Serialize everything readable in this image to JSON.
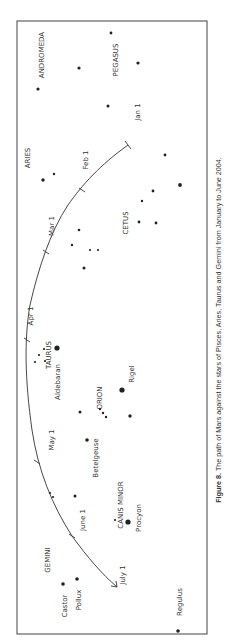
{
  "figure": {
    "caption_bold": "Figure 8.",
    "caption_text": " The path of Mars against the stars of Pisces, Aries, Taurus and Gemini from January to June 2004."
  },
  "colors": {
    "ink": "#222222",
    "frame": "#444444",
    "background": "#ffffff"
  },
  "chart_data": {
    "type": "scatter",
    "title": "The path of Mars against the stars of Pisces, Aries, Taurus and Gemini from January to June 2004",
    "orientation": "rotated 90° counter-clockwise (landscape figure on portrait page)",
    "frame": {
      "x0": 17,
      "y0": 21,
      "x1": 207,
      "y1": 634
    },
    "constellations": [
      {
        "name": "ANDROMEDA",
        "x": 44,
        "y": 55
      },
      {
        "name": "PEGASUS",
        "x": 118,
        "y": 60
      },
      {
        "name": "ARIES",
        "x": 30,
        "y": 158
      },
      {
        "name": "CETUS",
        "x": 128,
        "y": 223
      },
      {
        "name": "TAURUS",
        "x": 51,
        "y": 355
      },
      {
        "name": "ORION",
        "x": 102,
        "y": 398
      },
      {
        "name": "CANIS MINOR",
        "x": 123,
        "y": 505
      },
      {
        "name": "GEMINI",
        "x": 50,
        "y": 560
      }
    ],
    "named_stars": [
      {
        "name": "Aldebaran",
        "x": 57,
        "y": 348,
        "label_x": 60,
        "label_y": 382
      },
      {
        "name": "Rigel",
        "x": 122,
        "y": 390,
        "label_x": 134,
        "label_y": 374
      },
      {
        "name": "Betelgeuse",
        "x": 87,
        "y": 440,
        "label_x": 98,
        "label_y": 458
      },
      {
        "name": "Procyon",
        "x": 128,
        "y": 522,
        "label_x": 141,
        "label_y": 518
      },
      {
        "name": "Castor",
        "x": 63,
        "y": 584,
        "label_x": 67,
        "label_y": 606
      },
      {
        "name": "Pollux",
        "x": 77,
        "y": 579,
        "label_x": 81,
        "label_y": 600
      },
      {
        "name": "Regulus",
        "x": 178,
        "y": 631,
        "label_x": 182,
        "label_y": 602
      }
    ],
    "stars": [
      {
        "x": 38,
        "y": 89,
        "r": 1.6
      },
      {
        "x": 79,
        "y": 68,
        "r": 1.6
      },
      {
        "x": 111,
        "y": 33,
        "r": 1.4
      },
      {
        "x": 138,
        "y": 63,
        "r": 1.6
      },
      {
        "x": 108,
        "y": 106,
        "r": 1.5
      },
      {
        "x": 165,
        "y": 155,
        "r": 1.4
      },
      {
        "x": 43,
        "y": 180,
        "r": 1.7
      },
      {
        "x": 54,
        "y": 174,
        "r": 1.2
      },
      {
        "x": 180,
        "y": 185,
        "r": 1.9
      },
      {
        "x": 153,
        "y": 191,
        "r": 1.4
      },
      {
        "x": 142,
        "y": 201,
        "r": 1.2
      },
      {
        "x": 139,
        "y": 222,
        "r": 1.4
      },
      {
        "x": 156,
        "y": 223,
        "r": 1.4
      },
      {
        "x": 79,
        "y": 230,
        "r": 1.3
      },
      {
        "x": 72,
        "y": 245,
        "r": 1.2
      },
      {
        "x": 90,
        "y": 250,
        "r": 1.1
      },
      {
        "x": 98,
        "y": 250,
        "r": 1.1
      },
      {
        "x": 84,
        "y": 268,
        "r": 1.5
      },
      {
        "x": 35,
        "y": 362,
        "r": 1.1
      },
      {
        "x": 39,
        "y": 355,
        "r": 1.1
      },
      {
        "x": 45,
        "y": 361,
        "r": 1.1
      },
      {
        "x": 44,
        "y": 349,
        "r": 1.1
      },
      {
        "x": 80,
        "y": 412,
        "r": 1.5
      },
      {
        "x": 100,
        "y": 409,
        "r": 1.2
      },
      {
        "x": 103,
        "y": 413,
        "r": 1.2
      },
      {
        "x": 106,
        "y": 417,
        "r": 1.2
      },
      {
        "x": 130,
        "y": 416,
        "r": 1.7
      },
      {
        "x": 75,
        "y": 496,
        "r": 1.5
      },
      {
        "x": 115,
        "y": 520,
        "r": 1.1
      },
      {
        "x": 50,
        "y": 493,
        "r": 1.1
      },
      {
        "x": 53,
        "y": 497,
        "r": 1.1
      }
    ],
    "mars_path": {
      "description": "Arc from Jan 1 (upper right) curving left through Apr 1 and down to July 1 (lower left), ending in an arrow",
      "dates": [
        {
          "label": "Jan 1",
          "x": 128,
          "y": 145,
          "label_x": 140,
          "label_y": 112
        },
        {
          "label": "Feb 1",
          "x": 82,
          "y": 190,
          "label_x": 88,
          "label_y": 160
        },
        {
          "label": "Mar 1",
          "x": 46,
          "y": 252,
          "label_x": 54,
          "label_y": 226
        },
        {
          "label": "Apr 1",
          "x": 27,
          "y": 340,
          "label_x": 33,
          "label_y": 316
        },
        {
          "label": "May 1",
          "x": 37,
          "y": 462,
          "label_x": 54,
          "label_y": 440
        },
        {
          "label": "June 1",
          "x": 72,
          "y": 536,
          "label_x": 85,
          "label_y": 520
        },
        {
          "label": "July 1",
          "x": 117,
          "y": 587,
          "label_x": 125,
          "label_y": 575
        }
      ]
    }
  }
}
